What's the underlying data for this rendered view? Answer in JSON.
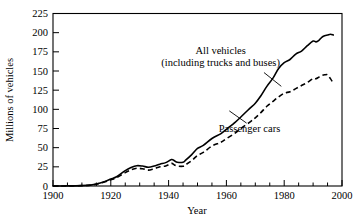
{
  "chart_data": {
    "type": "line",
    "title": "",
    "xlabel": "Year",
    "ylabel": "Millions of vehicles",
    "xlim": [
      1900,
      2000
    ],
    "ylim": [
      0,
      225
    ],
    "xticks": [
      1900,
      1920,
      1940,
      1960,
      1980,
      2000
    ],
    "xtick_labels": [
      "1900",
      "1920",
      "1940",
      "1960",
      "1980",
      "2000"
    ],
    "xminor_step": 5,
    "yticks": [
      0,
      25,
      50,
      75,
      100,
      125,
      150,
      175,
      200,
      225
    ],
    "ytick_labels": [
      "0",
      "25",
      "50",
      "75",
      "100",
      "125",
      "150",
      "175",
      "200",
      "225"
    ],
    "grid": false,
    "legend_position": "inline-annotations",
    "annotations": [
      {
        "name": "all-vehicles",
        "lines": [
          "All vehicles",
          "(including trucks and buses)"
        ],
        "text_x": 1958,
        "text_y": 172,
        "leader_from": [
          1973,
          148
        ],
        "leader_to": [
          1979,
          130
        ]
      },
      {
        "name": "passenger-cars",
        "lines": [
          "Passenger cars"
        ],
        "text_x": 1968,
        "text_y": 70,
        "leader_from": [
          1967,
          82
        ],
        "leader_to": [
          1961,
          98
        ]
      }
    ],
    "series": [
      {
        "name": "All vehicles (including trucks and buses)",
        "style": "solid",
        "x": [
          1900,
          1905,
          1910,
          1913,
          1915,
          1918,
          1920,
          1922,
          1925,
          1927,
          1929,
          1931,
          1933,
          1935,
          1937,
          1939,
          1941,
          1942,
          1943,
          1945,
          1946,
          1948,
          1950,
          1952,
          1955,
          1958,
          1960,
          1963,
          1965,
          1968,
          1970,
          1972,
          1974,
          1976,
          1978,
          1980,
          1982,
          1984,
          1986,
          1988,
          1990,
          1991,
          1992,
          1993,
          1994,
          1995,
          1996,
          1997
        ],
        "y": [
          0,
          0.1,
          0.5,
          1.2,
          2.5,
          6,
          9,
          12,
          20,
          24,
          26.5,
          26,
          24.5,
          26,
          28.5,
          30.5,
          34.5,
          33,
          31,
          31,
          34,
          41,
          49,
          53,
          62,
          68,
          74,
          83,
          90,
          101,
          108,
          118,
          130,
          140,
          153,
          161,
          165,
          172,
          176,
          183,
          189,
          188,
          190,
          194,
          196,
          197,
          198,
          197
        ]
      },
      {
        "name": "Passenger cars",
        "style": "dashed",
        "x": [
          1900,
          1905,
          1910,
          1913,
          1915,
          1918,
          1920,
          1922,
          1925,
          1927,
          1929,
          1931,
          1933,
          1935,
          1937,
          1939,
          1941,
          1942,
          1943,
          1945,
          1946,
          1948,
          1950,
          1952,
          1955,
          1958,
          1960,
          1963,
          1965,
          1968,
          1970,
          1972,
          1974,
          1976,
          1978,
          1980,
          1982,
          1984,
          1986,
          1988,
          1990,
          1991,
          1992,
          1993,
          1994,
          1995,
          1996,
          1997
        ],
        "y": [
          0,
          0.1,
          0.5,
          1.1,
          2.3,
          5.5,
          8.2,
          10.8,
          17.5,
          21,
          23.1,
          22.5,
          20.7,
          22.6,
          25,
          26.2,
          29.5,
          27.5,
          26,
          25.8,
          28,
          33,
          40,
          43.8,
          52.1,
          56.9,
          61.7,
          69,
          75,
          83,
          89,
          96,
          104,
          110,
          116,
          121,
          123,
          127,
          131,
          135,
          140,
          140,
          142,
          144,
          145,
          145,
          140,
          134
        ]
      }
    ]
  },
  "axes": {
    "x_title": "Year",
    "y_title": "Millions of vehicles"
  }
}
